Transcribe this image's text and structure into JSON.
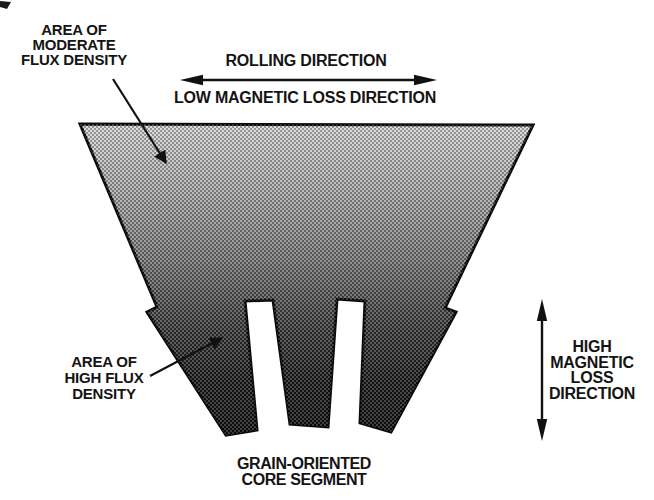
{
  "labels": {
    "moderate_flux": {
      "lines": [
        "AREA OF",
        "MODERATE",
        "FLUX DENSITY"
      ]
    },
    "rolling_direction": "ROLLING DIRECTION",
    "low_magnetic_loss": "LOW MAGNETIC LOSS DIRECTION",
    "high_flux": {
      "lines": [
        "AREA OF",
        "HIGH FLUX",
        "DENSITY"
      ]
    },
    "high_magnetic_loss": {
      "lines": [
        "HIGH",
        "MAGNETIC",
        "LOSS",
        "DIRECTION"
      ]
    },
    "caption": {
      "lines": [
        "GRAIN-ORIENTED",
        "CORE SEGMENT"
      ]
    }
  },
  "colors": {
    "ink": "#111111",
    "background": "#ffffff",
    "shade_stops": [
      "#d8d8d8",
      "#adadad",
      "#7a7a7a",
      "#3f3f3f",
      "#1c1c1c",
      "#0f0f0f"
    ]
  }
}
